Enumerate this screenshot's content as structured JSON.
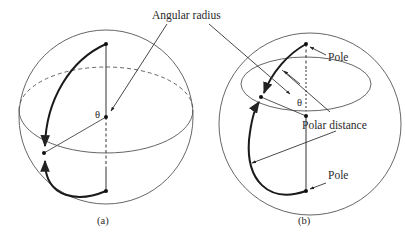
{
  "figure": {
    "labels": {
      "angular_radius": "Angular radius",
      "polar_distance": "Polar distance",
      "pole_top": "Pole",
      "pole_bottom": "Pole",
      "theta_a": "θ",
      "theta_b": "θ"
    },
    "captions": {
      "a": "(a)",
      "b": "(b)"
    },
    "colors": {
      "line": "#333333",
      "thin": "#555555",
      "background": "#ffffff"
    }
  }
}
